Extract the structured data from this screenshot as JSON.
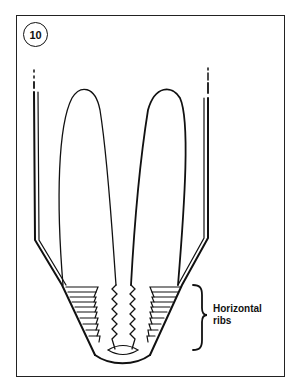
{
  "figure": {
    "number": "10",
    "annotation": {
      "line1": "Horizontal",
      "line2": "ribs"
    },
    "colors": {
      "ink": "#111111",
      "frame": "#222222",
      "background": "#ffffff"
    },
    "rib_count_per_side": 10
  }
}
